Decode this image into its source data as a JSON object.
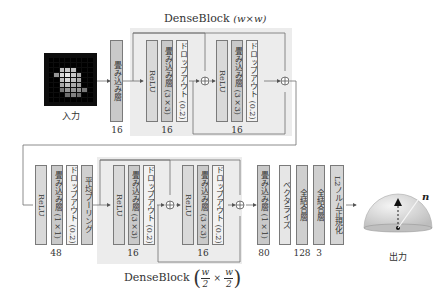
{
  "input": {
    "caption": "入力",
    "grid_cells": [
      [
        0,
        0,
        0,
        0,
        0,
        0,
        0,
        0
      ],
      [
        0,
        0,
        0,
        0,
        0,
        0,
        0,
        0
      ],
      [
        0,
        0,
        190,
        200,
        190,
        0,
        0,
        0
      ],
      [
        0,
        150,
        215,
        230,
        200,
        170,
        0,
        0
      ],
      [
        0,
        0,
        190,
        215,
        190,
        170,
        0,
        0
      ],
      [
        0,
        0,
        170,
        190,
        170,
        160,
        0,
        0
      ],
      [
        0,
        0,
        120,
        150,
        150,
        150,
        120,
        0
      ],
      [
        0,
        0,
        0,
        110,
        130,
        110,
        0,
        0
      ],
      [
        0,
        0,
        0,
        0,
        0,
        0,
        0,
        0
      ]
    ]
  },
  "row1": {
    "stem": {
      "label": "畳み込み層",
      "channels": "16"
    },
    "dense_block": {
      "title": "DenseBlock",
      "size": "(w×w)",
      "units": [
        {
          "layers": [
            "ReLU",
            "畳み込み層 (3×3)",
            "ドロップアウト (0.2)"
          ],
          "channels": "16"
        },
        {
          "layers": [
            "ReLU",
            "畳み込み層 (3×3)",
            "ドロップアウト (0.2)"
          ],
          "channels": "16"
        }
      ]
    }
  },
  "row2": {
    "transition": {
      "layers": [
        "ReLU",
        "畳み込み層 (1×1)",
        "ドロップアウト (0.2)",
        "平均プーリング"
      ],
      "channels": "48"
    },
    "dense_block": {
      "title": "DenseBlock",
      "size_num": "w",
      "size_den": "2",
      "size_times": "×",
      "units": [
        {
          "layers": [
            "ReLU",
            "畳み込み層 (3×3)",
            "ドロップアウト (0.2)"
          ],
          "channels": "16"
        },
        {
          "layers": [
            "ReLU",
            "畳み込み層 (3×3)",
            "ドロップアウト (0.2)"
          ],
          "channels": "16"
        }
      ]
    },
    "head": [
      {
        "label": "畳み込み層 (1×1)",
        "channels": "80"
      },
      {
        "label": "ベクタライズ",
        "channels": ""
      },
      {
        "label": "全結合層",
        "channels": "128"
      },
      {
        "label": "全結合層",
        "channels": "3"
      },
      {
        "label": "L2ノルム正規化",
        "channels": ""
      }
    ]
  },
  "output": {
    "caption": "出力",
    "vector_label": "n"
  },
  "colors": {
    "region_bg": "#ececec",
    "line": "#6e6e6e",
    "border": "#7a7a7a"
  }
}
